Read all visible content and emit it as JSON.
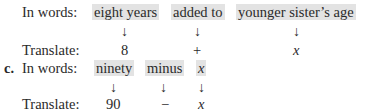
{
  "part_b": {
    "in_words_label": "In words:",
    "translate_label": "Translate:",
    "phrases": [
      "eight years",
      "added to",
      "younger sister’s age"
    ],
    "arrows": [
      "↓",
      "↓",
      "↓"
    ],
    "translations": [
      "8",
      "+",
      "x"
    ]
  },
  "part_c": {
    "item_label": "c.",
    "in_words_label": "In words:",
    "translate_label": "Translate:",
    "phrases": [
      "ninety",
      "minus",
      "x"
    ],
    "arrows": [
      "↓",
      "↓",
      "↓"
    ],
    "translations": [
      "90",
      "−",
      "x"
    ]
  }
}
